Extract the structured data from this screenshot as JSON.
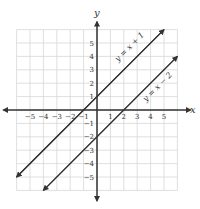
{
  "chart_data": {
    "type": "line",
    "title": "",
    "xlabel": "x",
    "ylabel": "y",
    "xlim": [
      -6,
      6
    ],
    "ylim": [
      -6,
      6
    ],
    "grid": true,
    "x_ticks": [
      "−5",
      "−4",
      "−3",
      "−2",
      "−1",
      "1",
      "2",
      "3",
      "4",
      "5"
    ],
    "y_ticks": [
      "5",
      "4",
      "3",
      "2",
      "1",
      "−1",
      "−2",
      "−3",
      "−4",
      "−5"
    ],
    "series": [
      {
        "name": "y = x + 1",
        "slope": 1,
        "intercept": 1,
        "x": [
          -6,
          5
        ],
        "y": [
          -5,
          6
        ]
      },
      {
        "name": "y = x − 2",
        "slope": 1,
        "intercept": -2,
        "x": [
          -4,
          6
        ],
        "y": [
          -6,
          4
        ]
      }
    ]
  }
}
